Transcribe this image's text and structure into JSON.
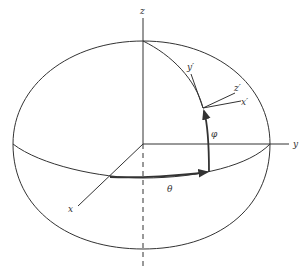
{
  "diagram": {
    "type": "spherical-coordinates",
    "labels": {
      "z_axis": "z",
      "y_axis": "y",
      "x_axis": "x",
      "theta": "θ",
      "phi": "φ",
      "x_prime": "x′",
      "y_prime": "y′",
      "z_prime": "z′"
    },
    "colors": {
      "line": "#333333",
      "background": "#ffffff"
    }
  }
}
